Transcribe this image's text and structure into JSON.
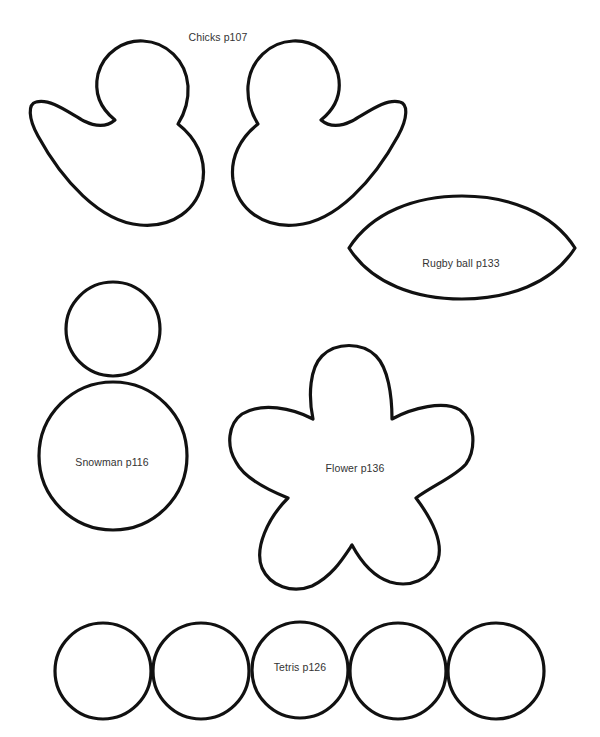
{
  "page": {
    "background": "#ffffff",
    "stroke_color": "#111111"
  },
  "templates": {
    "chicks": {
      "label": "Chicks p107",
      "pieces": 2
    },
    "rugby": {
      "label": "Rugby ball p133",
      "pieces": 1
    },
    "snowman": {
      "label": "Snowman p116",
      "pieces": 2
    },
    "flower": {
      "label": "Flower p136",
      "pieces": 1,
      "petals": 5
    },
    "tetris": {
      "label": "Tetris p126",
      "pieces": 5
    }
  }
}
